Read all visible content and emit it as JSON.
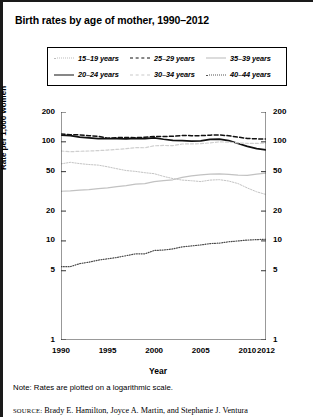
{
  "figure": {
    "title": "Birth rates by age of mother, 1990–2012",
    "note": "Note: Rates are plotted on a logarithmic scale.",
    "source_prefix": "SOURCE:",
    "source_text": "Brady E. Hamilton, Joyce A. Martin, and Stephanie J. Ventura"
  },
  "axes": {
    "xlabel": "Year",
    "ylabel": "Rate per 1,000 women",
    "xticks": [
      "1990",
      "1995",
      "2000",
      "2005",
      "2010",
      "2012"
    ],
    "yticks_left": [
      "200",
      "100",
      "50",
      "20",
      "10",
      "5",
      "1"
    ],
    "yticks_right": [
      "200",
      "100",
      "50",
      "20",
      "10",
      "5",
      "1"
    ]
  },
  "legend": {
    "entries": [
      {
        "label": "15–19 years",
        "style": "sw-dot-light",
        "key": "15-19"
      },
      {
        "label": "25–29 years",
        "style": "sw-dash-dark",
        "key": "25-29"
      },
      {
        "label": "35–39 years",
        "style": "sw-solid-light",
        "key": "35-39"
      },
      {
        "label": "20–24 years",
        "style": "sw-solid-dark",
        "key": "20-24"
      },
      {
        "label": "30–34 years",
        "style": "sw-dash-light",
        "key": "30-34"
      },
      {
        "label": "40–44 years",
        "style": "sw-dot-dark",
        "key": "40-44"
      }
    ]
  },
  "chart_data": {
    "type": "line",
    "title": "Birth rates by age of mother, 1990–2012",
    "xlabel": "Year",
    "ylabel": "Rate per 1,000 women",
    "yscale": "log",
    "ylim": [
      1,
      200
    ],
    "xlim": [
      1990,
      2012
    ],
    "grid": false,
    "legend_position": "top",
    "annotations": [
      "Note: Rates are plotted on a logarithmic scale."
    ],
    "x": [
      1990,
      1991,
      1992,
      1993,
      1994,
      1995,
      1996,
      1997,
      1998,
      1999,
      2000,
      2001,
      2002,
      2003,
      2004,
      2005,
      2006,
      2007,
      2008,
      2009,
      2010,
      2011,
      2012
    ],
    "series": [
      {
        "name": "15–19 years",
        "values": [
          59.9,
          62.1,
          60.3,
          59.0,
          58.2,
          56.0,
          53.5,
          51.3,
          50.3,
          48.8,
          47.7,
          44.8,
          42.6,
          41.1,
          40.5,
          39.7,
          41.1,
          41.5,
          40.2,
          37.9,
          34.2,
          31.3,
          29.4
        ]
      },
      {
        "name": "20–24 years",
        "values": [
          116.5,
          115.3,
          111.6,
          109.5,
          107.6,
          107.5,
          107.8,
          107.3,
          108.4,
          107.9,
          109.7,
          106.2,
          103.6,
          102.6,
          101.7,
          102.2,
          105.9,
          106.3,
          103.0,
          96.3,
          90.0,
          85.3,
          83.1
        ]
      },
      {
        "name": "25–29 years",
        "values": [
          120.2,
          118.2,
          117.4,
          115.4,
          113.9,
          108.8,
          110.4,
          110.4,
          110.2,
          111.2,
          113.5,
          113.4,
          113.6,
          115.6,
          115.5,
          115.5,
          116.8,
          117.5,
          115.1,
          111.5,
          108.3,
          107.2,
          106.5
        ]
      },
      {
        "name": "30–34 years",
        "values": [
          80.8,
          79.5,
          80.2,
          80.8,
          81.5,
          82.6,
          83.9,
          85.3,
          87.4,
          87.1,
          91.2,
          91.9,
          91.5,
          95.1,
          95.3,
          95.8,
          97.7,
          99.9,
          99.3,
          97.5,
          96.5,
          96.4,
          97.3
        ]
      },
      {
        "name": "35–39 years",
        "values": [
          31.7,
          32.0,
          32.5,
          32.9,
          33.7,
          34.3,
          35.3,
          36.1,
          37.4,
          37.8,
          39.7,
          40.6,
          41.4,
          43.8,
          45.4,
          46.3,
          47.3,
          47.5,
          46.9,
          46.1,
          45.9,
          47.2,
          48.3
        ]
      },
      {
        "name": "40–44 years",
        "values": [
          5.5,
          5.5,
          5.9,
          6.1,
          6.4,
          6.6,
          6.8,
          7.1,
          7.4,
          7.4,
          8.0,
          8.1,
          8.3,
          8.7,
          8.9,
          9.1,
          9.4,
          9.5,
          9.8,
          10.0,
          10.2,
          10.3,
          10.4
        ]
      }
    ]
  }
}
